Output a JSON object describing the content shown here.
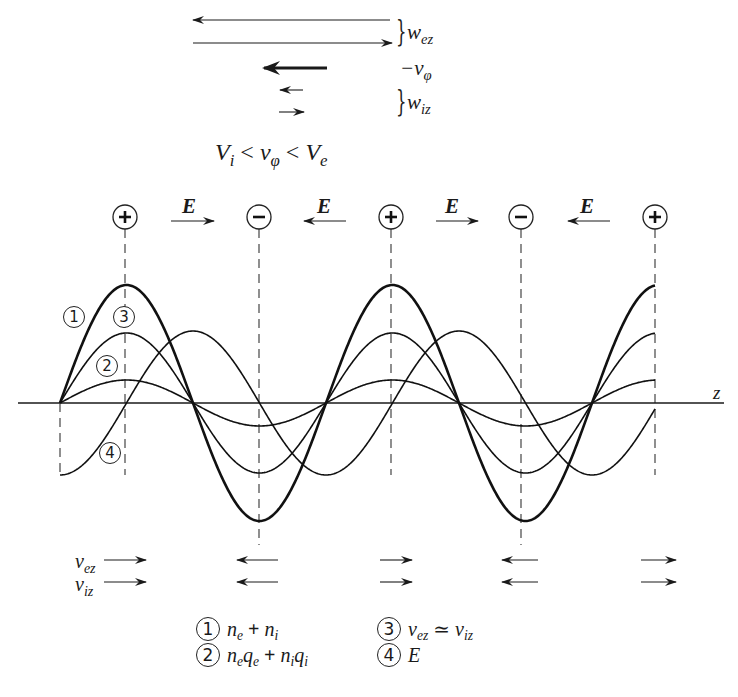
{
  "figure": {
    "velocity_key": {
      "w_ez_label": "w",
      "w_ez_sub": "ez",
      "minus_v_phi_label": "−v",
      "minus_v_phi_sub": "φ",
      "w_iz_label": "w",
      "w_iz_sub": "iz",
      "arrows": [
        {
          "name": "w_ez_left",
          "x1": 390,
          "x2": 193,
          "y": 20,
          "weight": "thin",
          "direction": "left"
        },
        {
          "name": "w_ez_right",
          "x1": 193,
          "x2": 392,
          "y": 43,
          "weight": "thin",
          "direction": "right"
        },
        {
          "name": "minus_v_phi",
          "x1": 327,
          "x2": 264,
          "y": 68,
          "weight": "thick",
          "direction": "left"
        },
        {
          "name": "w_iz_left",
          "x1": 303,
          "x2": 280,
          "y": 90,
          "weight": "thin",
          "direction": "left"
        },
        {
          "name": "w_iz_right",
          "x1": 279,
          "x2": 304,
          "y": 112,
          "weight": "thin",
          "direction": "right"
        }
      ]
    },
    "condition": {
      "V_i": "V",
      "V_i_sub": "i",
      "lt1": " < ",
      "v_phi": "v",
      "v_phi_sub": "φ",
      "lt2": " < ",
      "V_e": "V",
      "V_e_sub": "e"
    },
    "charges": [
      {
        "sign": "+",
        "x": 125
      },
      {
        "sign": "−",
        "x": 259
      },
      {
        "sign": "+",
        "x": 391
      },
      {
        "sign": "−",
        "x": 521
      },
      {
        "sign": "+",
        "x": 655
      }
    ],
    "field_arrows": [
      {
        "label": "E",
        "direction": "right",
        "x1": 171,
        "x2": 214
      },
      {
        "label": "E",
        "direction": "left",
        "x1": 346,
        "x2": 304
      },
      {
        "label": "E",
        "direction": "right",
        "x1": 436,
        "x2": 478
      },
      {
        "label": "E",
        "direction": "left",
        "x1": 610,
        "x2": 568
      }
    ],
    "axis_label": "z",
    "curve_labels": [
      "1",
      "3",
      "2",
      "4"
    ],
    "particle_velocity_rows": {
      "v_ez_label": "v",
      "v_ez_sub": "ez",
      "v_iz_label": "v",
      "v_iz_sub": "iz",
      "columns": [
        {
          "direction": "right",
          "x1": 104,
          "x2": 146
        },
        {
          "direction": "left",
          "x1": 278,
          "x2": 237
        },
        {
          "direction": "right",
          "x1": 380,
          "x2": 412
        },
        {
          "direction": "left",
          "x1": 538,
          "x2": 502
        },
        {
          "direction": "right",
          "x1": 641,
          "x2": 676
        }
      ]
    },
    "legend": [
      {
        "num": "1",
        "expr_html": "n_e + n_i"
      },
      {
        "num": "2",
        "expr_html": "n_e q_e + n_i q_i"
      },
      {
        "num": "3",
        "expr_html": "v_ez ≃ v_iz"
      },
      {
        "num": "4",
        "expr_html": "E"
      }
    ]
  },
  "chart_data": {
    "type": "line",
    "title": "",
    "xlabel": "z",
    "ylabel": "",
    "grid": false,
    "x_period_px": 266,
    "x_origin_px": 60,
    "axis_y_px": 403,
    "series": [
      {
        "name": "1: n_e + n_i",
        "shape": "sin",
        "amplitude_px": 118,
        "phase": 0,
        "weight": "bold"
      },
      {
        "name": "3: v_ez ≃ v_iz",
        "shape": "sin",
        "amplitude_px": 70,
        "phase": 0
      },
      {
        "name": "2: n_e q_e + n_i q_i",
        "shape": "sin",
        "amplitude_px": 23,
        "phase": 0
      },
      {
        "name": "4: E",
        "shape": "-cos",
        "amplitude_px": 72,
        "phase": 0
      }
    ],
    "x_range_px": [
      60,
      655
    ]
  }
}
